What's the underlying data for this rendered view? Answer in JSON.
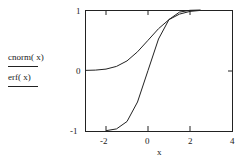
{
  "legend": [
    {
      "label": "cnorm( x)",
      "style": "solid"
    },
    {
      "label": "erf( x)",
      "style": "solid"
    }
  ],
  "axes": {
    "xlabel": "x",
    "xticks": [
      "-2",
      "0",
      "2",
      "4"
    ],
    "yticks": [
      "1",
      "0",
      "-1"
    ]
  },
  "chart_data": {
    "type": "line",
    "title": "",
    "xlabel": "x",
    "ylabel": "",
    "xlim": [
      -3,
      4
    ],
    "ylim": [
      -1,
      1
    ],
    "grid": false,
    "legend_position": "left",
    "x_ticks": [
      -2,
      0,
      2,
      4
    ],
    "y_ticks": [
      -1,
      0,
      1
    ],
    "series": [
      {
        "name": "cnorm(x)",
        "x": [
          -3,
          -2.5,
          -2,
          -1.5,
          -1,
          -0.5,
          0,
          0.5,
          1,
          1.5,
          2,
          2.5
        ],
        "values": [
          0.001,
          0.006,
          0.023,
          0.067,
          0.159,
          0.309,
          0.5,
          0.691,
          0.841,
          0.933,
          0.977,
          0.994
        ]
      },
      {
        "name": "erf(x)",
        "x": [
          -2,
          -1.5,
          -1,
          -0.5,
          0,
          0.5,
          1,
          1.5,
          2,
          2.5
        ],
        "values": [
          -0.995,
          -0.966,
          -0.843,
          -0.52,
          0,
          0.52,
          0.843,
          0.966,
          0.995,
          1.0
        ]
      }
    ]
  }
}
